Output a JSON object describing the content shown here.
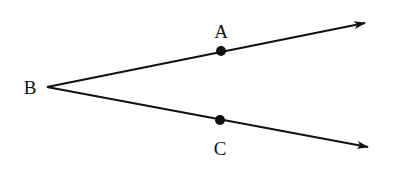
{
  "diagram": {
    "vertex": {
      "label": "B",
      "x": 47,
      "y": 87,
      "label_x": 30,
      "label_y": 94
    },
    "rays": [
      {
        "id": "ray-BA",
        "from": "B",
        "through": "A",
        "start": [
          47,
          87
        ],
        "end": [
          365,
          23
        ],
        "point": {
          "label": "A",
          "x": 221,
          "y": 51,
          "label_x": 221,
          "label_y": 38
        }
      },
      {
        "id": "ray-BC",
        "from": "B",
        "through": "C",
        "start": [
          47,
          87
        ],
        "end": [
          368,
          147
        ],
        "point": {
          "label": "C",
          "x": 220,
          "y": 120,
          "label_x": 220,
          "label_y": 155
        }
      }
    ],
    "colors": {
      "stroke": "#111111",
      "background": "#ffffff"
    }
  }
}
